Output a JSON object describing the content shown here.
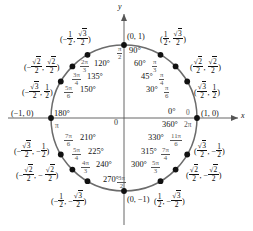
{
  "figure": {
    "type": "unit-circle",
    "axes": {
      "x_label": "x",
      "y_label": "y",
      "origin_label": "0"
    },
    "colors": {
      "circle": "#6b6b6b",
      "axis": "#555555",
      "point": "#111111",
      "radian": "#666666"
    },
    "geometry": {
      "center_x": 124,
      "center_y": 118,
      "radius": 73
    }
  },
  "points": [
    {
      "angle_deg": 0,
      "degrees": "0°",
      "radians_num": "0",
      "radians_den": "",
      "coord_x": "1",
      "coord_y": "0"
    },
    {
      "angle_deg": 360,
      "degrees": "360°",
      "radians_num": "2π",
      "radians_den": "",
      "coord_x": "1",
      "coord_y": "0"
    },
    {
      "angle_deg": 30,
      "degrees": "30°",
      "radians_num": "π",
      "radians_den": "6",
      "coord_x": "√3/2",
      "coord_y": "1/2"
    },
    {
      "angle_deg": 45,
      "degrees": "45°",
      "radians_num": "π",
      "radians_den": "4",
      "coord_x": "√2/2",
      "coord_y": "√2/2"
    },
    {
      "angle_deg": 60,
      "degrees": "60°",
      "radians_num": "π",
      "radians_den": "3",
      "coord_x": "1/2",
      "coord_y": "√3/2"
    },
    {
      "angle_deg": 90,
      "degrees": "90°",
      "radians_num": "π",
      "radians_den": "2",
      "coord_x": "0",
      "coord_y": "1"
    },
    {
      "angle_deg": 120,
      "degrees": "120°",
      "radians_num": "2π",
      "radians_den": "3",
      "coord_x": "-1/2",
      "coord_y": "√3/2"
    },
    {
      "angle_deg": 135,
      "degrees": "135°",
      "radians_num": "3π",
      "radians_den": "4",
      "coord_x": "-√2/2",
      "coord_y": "√2/2"
    },
    {
      "angle_deg": 150,
      "degrees": "150°",
      "radians_num": "5π",
      "radians_den": "6",
      "coord_x": "-√3/2",
      "coord_y": "1/2"
    },
    {
      "angle_deg": 180,
      "degrees": "180°",
      "radians_num": "π",
      "radians_den": "",
      "coord_x": "-1",
      "coord_y": "0"
    },
    {
      "angle_deg": 210,
      "degrees": "210°",
      "radians_num": "7π",
      "radians_den": "6",
      "coord_x": "-√3/2",
      "coord_y": "-1/2"
    },
    {
      "angle_deg": 225,
      "degrees": "225°",
      "radians_num": "5π",
      "radians_den": "4",
      "coord_x": "-√2/2",
      "coord_y": "-√2/2"
    },
    {
      "angle_deg": 240,
      "degrees": "240°",
      "radians_num": "4π",
      "radians_den": "3",
      "coord_x": "-1/2",
      "coord_y": "-√3/2"
    },
    {
      "angle_deg": 270,
      "degrees": "270°",
      "radians_num": "3π",
      "radians_den": "2",
      "coord_x": "0",
      "coord_y": "-1"
    },
    {
      "angle_deg": 300,
      "degrees": "300°",
      "radians_num": "5π",
      "radians_den": "3",
      "coord_x": "1/2",
      "coord_y": "-√3/2"
    },
    {
      "angle_deg": 315,
      "degrees": "315°",
      "radians_num": "7π",
      "radians_den": "4",
      "coord_x": "√2/2",
      "coord_y": "-√2/2"
    },
    {
      "angle_deg": 330,
      "degrees": "330°",
      "radians_num": "11π",
      "radians_den": "6",
      "coord_x": "√3/2",
      "coord_y": "-1/2"
    }
  ],
  "labels": {
    "axis_x": "x",
    "axis_y": "y",
    "origin": "0",
    "coord_0_1": "(0, 1)",
    "coord_1_0": "(1, 0)",
    "coord_m1_0": "(−1, 0)",
    "coord_0_m1": "(0, −1)",
    "deg_0": "0°",
    "rad_0": "0",
    "deg_30": "30°",
    "deg_45": "45°",
    "deg_60": "60°",
    "deg_90": "90°",
    "deg_120": "120°",
    "deg_135": "135°",
    "deg_150": "150°",
    "deg_180": "180°",
    "deg_210": "210°",
    "deg_225": "225°",
    "deg_240": "240°",
    "deg_270": "270°",
    "deg_300": "300°",
    "deg_315": "315°",
    "deg_330": "330°",
    "deg_360": "360°",
    "rad_pi": "π",
    "rad_2pi": "2π"
  }
}
